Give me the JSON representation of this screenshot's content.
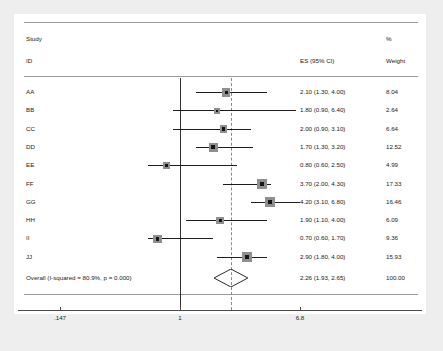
{
  "header": {
    "col_study": "Study",
    "col_id": "ID",
    "col_es": "ES (95% CI)",
    "col_pct": "%",
    "col_weight": "Weight"
  },
  "overall_label": "Overall  (I-squared = 80.9%, p = 0.000)",
  "axis": {
    "ticks": [
      {
        "label": ".147",
        "value": 0.147
      },
      {
        "label": "1",
        "value": 1
      },
      {
        "label": "6.8",
        "value": 6.8
      }
    ],
    "null_value": 1,
    "pooled_value": 2.26
  },
  "colors": {
    "page_background": "#eeeeee",
    "panel_background": "#ffffff",
    "text": "#1a1a1a",
    "null_line": "#333333",
    "pooled_line": "#8a8a8a",
    "ci_line": "#1d1d1d",
    "marker_fill": "#8f8f8f",
    "marker_core": "#151515",
    "axis": "#4a4a4a",
    "rule": "#9a9a9a"
  },
  "chart_data": {
    "type": "forest",
    "title": "",
    "xlabel": "",
    "ylabel": "",
    "xscale": "log",
    "xlim": [
      0.147,
      6.8
    ],
    "grid": false,
    "legend": null,
    "null_line": 1,
    "pooled_line": 2.26,
    "columns": [
      "Study ID",
      "ES (95% CI)",
      "% Weight"
    ],
    "studies": [
      {
        "id": "AA",
        "es": 2.1,
        "lcl": 1.3,
        "ucl": 4.0,
        "weight": 8.04,
        "es_text": "2.10 (1.30, 4.00)",
        "weight_text": "8.04"
      },
      {
        "id": "BB",
        "es": 1.8,
        "lcl": 0.9,
        "ucl": 6.4,
        "weight": 2.64,
        "es_text": "1.80 (0.90, 6.40)",
        "weight_text": "2.64"
      },
      {
        "id": "CC",
        "es": 2.0,
        "lcl": 0.9,
        "ucl": 3.1,
        "weight": 6.64,
        "es_text": "2.00 (0.90, 3.10)",
        "weight_text": "6.64"
      },
      {
        "id": "DD",
        "es": 1.7,
        "lcl": 1.3,
        "ucl": 3.2,
        "weight": 12.52,
        "es_text": "1.70 (1.30, 3.20)",
        "weight_text": "12.52"
      },
      {
        "id": "EE",
        "es": 0.8,
        "lcl": 0.6,
        "ucl": 2.5,
        "weight": 4.99,
        "es_text": "0.80 (0.60, 2.50)",
        "weight_text": "4.99"
      },
      {
        "id": "FF",
        "es": 3.7,
        "lcl": 2.0,
        "ucl": 4.3,
        "weight": 17.33,
        "es_text": "3.70 (2.00, 4.30)",
        "weight_text": "17.33"
      },
      {
        "id": "GG",
        "es": 4.2,
        "lcl": 3.1,
        "ucl": 6.8,
        "weight": 16.46,
        "es_text": "4.20 (3.10, 6.80)",
        "weight_text": "16.46"
      },
      {
        "id": "HH",
        "es": 1.9,
        "lcl": 1.1,
        "ucl": 4.0,
        "weight": 6.09,
        "es_text": "1.90 (1.10, 4.00)",
        "weight_text": "6.09"
      },
      {
        "id": "II",
        "es": 0.7,
        "lcl": 0.6,
        "ucl": 1.7,
        "weight": 9.36,
        "es_text": "0.70 (0.60, 1.70)",
        "weight_text": "9.36"
      },
      {
        "id": "JJ",
        "es": 2.9,
        "lcl": 1.8,
        "ucl": 4.0,
        "weight": 15.93,
        "es_text": "2.90 (1.80, 4.00)",
        "weight_text": "15.93"
      }
    ],
    "overall": {
      "label": "Overall  (I-squared = 80.9%, p = 0.000)",
      "es": 2.26,
      "lcl": 1.93,
      "ucl": 2.65,
      "weight": 100.0,
      "es_text": "2.26 (1.93, 2.65)",
      "weight_text": "100.00",
      "i_squared": "80.9%",
      "p_value": "0.000"
    }
  }
}
